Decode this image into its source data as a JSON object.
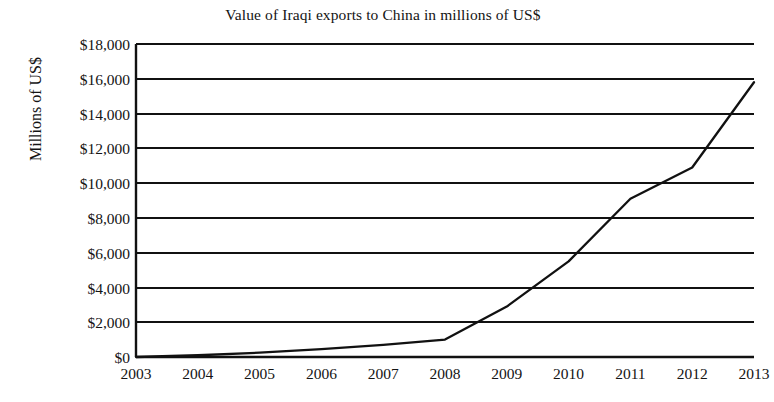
{
  "chart_data": {
    "type": "line",
    "title": "Value of Iraqi exports to China in millions of US$",
    "xlabel": "",
    "ylabel": "Millions of US$",
    "categories": [
      "2003",
      "2004",
      "2005",
      "2006",
      "2007",
      "2008",
      "2009",
      "2010",
      "2011",
      "2012",
      "2013"
    ],
    "x": [
      2003,
      2004,
      2005,
      2006,
      2007,
      2008,
      2009,
      2010,
      2011,
      2012,
      2013
    ],
    "values": [
      0,
      100,
      250,
      450,
      700,
      1000,
      2900,
      5500,
      9100,
      10900,
      15800
    ],
    "series": [
      {
        "name": "Value of Iraqi exports to China",
        "values": [
          0,
          100,
          250,
          450,
          700,
          1000,
          2900,
          5500,
          9100,
          10900,
          15800
        ]
      }
    ],
    "ylim": [
      0,
      18000
    ],
    "ytick_values": [
      0,
      2000,
      4000,
      6000,
      8000,
      10000,
      12000,
      14000,
      16000,
      18000
    ],
    "ytick_labels": [
      "$0",
      "$2,000",
      "$4,000",
      "$6,000",
      "$8,000",
      "$10,000",
      "$12,000",
      "$14,000",
      "$16,000",
      "$18,000"
    ],
    "xtick_labels": [
      "2003",
      "2004",
      "2005",
      "2006",
      "2007",
      "2008",
      "2009",
      "2010",
      "2011",
      "2012",
      "2013"
    ],
    "grid": "horizontal",
    "legend": "none",
    "line_color": "#111111",
    "background_color": "#ffffff"
  },
  "figure": {
    "title": "Value of Iraqi exports to China in millions of US$",
    "y_axis_title": "Millions of US$"
  }
}
